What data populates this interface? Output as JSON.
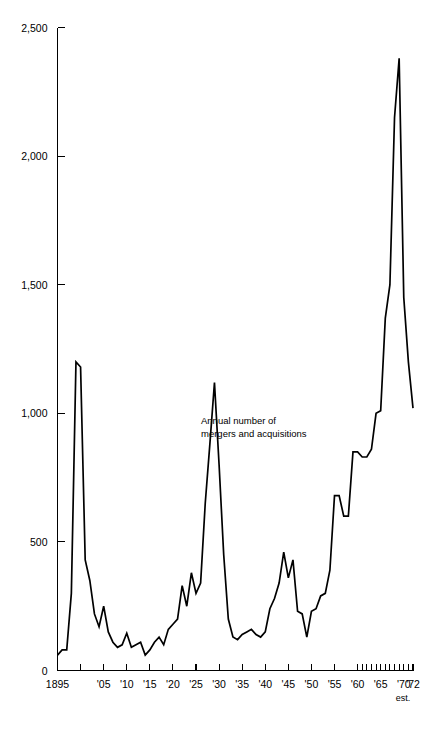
{
  "chart_data": {
    "type": "line",
    "title": "",
    "subtitle": "",
    "annotation": [
      "Annual number of",
      "mergers and acquisitions"
    ],
    "xlabel": "",
    "ylabel": "",
    "xlim": [
      1895,
      1972
    ],
    "ylim": [
      0,
      2500
    ],
    "grid": false,
    "legend": null,
    "line_color": "#000000",
    "background_color": "#ffffff",
    "y_ticks": [
      0,
      500,
      1000,
      1500,
      2000,
      2500
    ],
    "y_tick_labels": [
      "0",
      "500",
      "1,000",
      "1,500",
      "2,000",
      "2,500"
    ],
    "x_tick_labels": [
      {
        "year": 1895,
        "label": "1895"
      },
      {
        "year": 1900,
        "label": ""
      },
      {
        "year": 1905,
        "label": "'05"
      },
      {
        "year": 1910,
        "label": "'10"
      },
      {
        "year": 1915,
        "label": "'15"
      },
      {
        "year": 1920,
        "label": "'20"
      },
      {
        "year": 1925,
        "label": "'25"
      },
      {
        "year": 1930,
        "label": "'30"
      },
      {
        "year": 1935,
        "label": "'35"
      },
      {
        "year": 1940,
        "label": "'40"
      },
      {
        "year": 1945,
        "label": "'45"
      },
      {
        "year": 1950,
        "label": "'50"
      },
      {
        "year": 1955,
        "label": "'55"
      },
      {
        "year": 1960,
        "label": "'60"
      },
      {
        "year": 1965,
        "label": "'65"
      },
      {
        "year": 1970,
        "label": "'70"
      },
      {
        "year": 1972,
        "label": "'72"
      }
    ],
    "x_minor_ticks": [
      1961,
      1962,
      1963,
      1964,
      1966,
      1967,
      1968,
      1969,
      1971
    ],
    "footnote": "est.",
    "x": [
      1895,
      1896,
      1897,
      1898,
      1899,
      1900,
      1901,
      1902,
      1903,
      1904,
      1905,
      1906,
      1907,
      1908,
      1909,
      1910,
      1911,
      1912,
      1913,
      1914,
      1915,
      1916,
      1917,
      1918,
      1919,
      1920,
      1921,
      1922,
      1923,
      1924,
      1925,
      1926,
      1927,
      1928,
      1929,
      1930,
      1931,
      1932,
      1933,
      1934,
      1935,
      1936,
      1937,
      1938,
      1939,
      1940,
      1941,
      1942,
      1943,
      1944,
      1945,
      1946,
      1947,
      1948,
      1949,
      1950,
      1951,
      1952,
      1953,
      1954,
      1955,
      1956,
      1957,
      1958,
      1959,
      1960,
      1961,
      1962,
      1963,
      1964,
      1965,
      1966,
      1967,
      1968,
      1969,
      1970,
      1971,
      1972
    ],
    "y": [
      60,
      80,
      80,
      300,
      1200,
      1180,
      430,
      350,
      220,
      170,
      250,
      150,
      110,
      90,
      100,
      145,
      90,
      100,
      110,
      60,
      80,
      110,
      130,
      100,
      160,
      180,
      200,
      330,
      250,
      380,
      300,
      340,
      650,
      880,
      1120,
      800,
      450,
      200,
      130,
      120,
      140,
      150,
      160,
      140,
      130,
      150,
      240,
      280,
      340,
      460,
      360,
      430,
      230,
      220,
      130,
      230,
      240,
      290,
      300,
      390,
      680,
      680,
      600,
      600,
      850,
      850,
      830,
      830,
      860,
      1000,
      1010,
      1370,
      1500,
      2150,
      2380,
      1450,
      1200,
      1020
    ]
  }
}
